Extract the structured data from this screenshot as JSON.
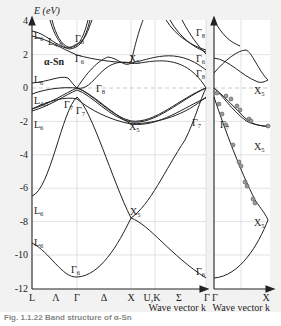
{
  "chart_data": {
    "type": "line",
    "title": "Band structure of α-Sn",
    "material_label": "α-Sn",
    "ylabel": "E (eV)",
    "xlabel_left": "Wave vector k",
    "xlabel_right": "Wave vector k",
    "ylim": [
      -12,
      4
    ],
    "yticks": [
      "4",
      "2",
      "0",
      "-2",
      "-4",
      "-6",
      "-8",
      "-10",
      "-12"
    ],
    "xticks_left": [
      "L",
      "Λ",
      "Γ",
      "Δ",
      "X",
      "U,K",
      "Σ",
      "Γ"
    ],
    "xticks_right": [
      "Γ",
      "X"
    ],
    "grid": true,
    "fermi_level_dashed": 0,
    "state_labels": [
      {
        "text": "L6",
        "k": "L",
        "E": 3.2
      },
      {
        "text": "L4,5",
        "k": "L",
        "E": 2.9
      },
      {
        "text": "Γ8",
        "k": "Γ",
        "E": 3.3
      },
      {
        "text": "Γ6",
        "k": "Γ",
        "E": 1.8
      },
      {
        "text": "X5",
        "k": "X",
        "E": 1.6
      },
      {
        "text": "L6",
        "k": "L",
        "E": 0.8
      },
      {
        "text": "Γ8",
        "k": "Γ",
        "E": 0.3
      },
      {
        "text": "L4,5",
        "k": "L",
        "E": -0.8
      },
      {
        "text": "L6",
        "k": "L",
        "E": -1.9
      },
      {
        "text": "Γ7",
        "k": "Γ",
        "E": -1.2
      },
      {
        "text": "Γ7",
        "k": "Γ",
        "E": -1.4
      },
      {
        "text": "X5",
        "k": "X",
        "E": -2.7
      },
      {
        "text": "L6",
        "k": "L",
        "E": -7.2
      },
      {
        "text": "X5",
        "k": "X",
        "E": -7.3
      },
      {
        "text": "L6",
        "k": "L",
        "E": -8.7
      },
      {
        "text": "Γ6",
        "k": "Γ",
        "E": -10.8
      },
      {
        "text": "Γ8",
        "k": "Γ(right)",
        "E": 3.4
      },
      {
        "text": "Γ6",
        "k": "Γ(right)",
        "E": 1.8
      },
      {
        "text": "Γ8",
        "k": "Γ(right)",
        "E": 1.0
      },
      {
        "text": "Γ7",
        "k": "Γ(right)",
        "E": -1.2
      },
      {
        "text": "Γ7",
        "k": "Γ(right)",
        "E": -1.4
      },
      {
        "text": "Γ6",
        "k": "Γ(right)",
        "E": -10.8
      },
      {
        "text": "X5",
        "k": "X(right)",
        "E": 0.8
      },
      {
        "text": "X5",
        "k": "X(right)",
        "E": -2.3
      },
      {
        "text": "X5",
        "k": "X(right)",
        "E": -8.0
      }
    ],
    "series": [
      {
        "name": "lowest valence band",
        "points": [
          [
            "L",
            -9.3
          ],
          [
            "Γ",
            -11.3
          ],
          [
            "X",
            -7.8
          ],
          [
            "K",
            -8.5
          ],
          [
            "Γ",
            -11.3
          ]
        ]
      },
      {
        "name": "second valence band",
        "points": [
          [
            "L",
            -6.5
          ],
          [
            "Γ",
            -0.6
          ],
          [
            "X",
            -7.8
          ],
          [
            "K",
            -6.5
          ],
          [
            "Γ",
            -0.6
          ]
        ]
      },
      {
        "name": "upper valence bands",
        "points": [
          [
            "L",
            -1.3
          ],
          [
            "Γ",
            0.0
          ],
          [
            "X",
            -2.7
          ],
          [
            "K",
            -2.4
          ],
          [
            "Γ",
            0.0
          ]
        ]
      },
      {
        "name": "conduction band",
        "points": [
          [
            "L",
            0.3
          ],
          [
            "Γ",
            0.0
          ],
          [
            "X",
            1.6
          ],
          [
            "K",
            1.3
          ],
          [
            "Γ",
            0.0
          ]
        ]
      },
      {
        "name": "higher conduction bands",
        "points": [
          [
            "L",
            3.3
          ],
          [
            "Γ",
            2.3
          ],
          [
            "X",
            1.6
          ],
          [
            "K",
            3.0
          ],
          [
            "Γ",
            2.3
          ]
        ]
      }
    ],
    "experimental_points": "grey circles along valence bands in right panel (Γ→X)"
  },
  "caption": "Fig. 1.1.22 Band structure of α-Sn"
}
